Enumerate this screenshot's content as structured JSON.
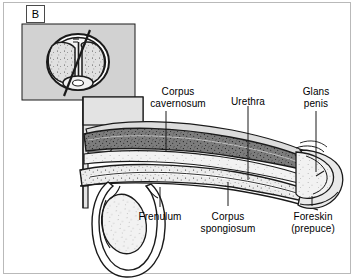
{
  "figure": {
    "panel_letter": "B",
    "background_color": "#ffffff",
    "inset_fill": "#d2d2d2",
    "body_wall_fill": "#e3e3e3",
    "cavernosum_fill": "#7c7c7c",
    "spongiosum_fill": "#e8e8e8",
    "outline_color": "#1a1a1a"
  },
  "labels": {
    "corpus_cavernosum": {
      "line1": "Corpus",
      "line2": "cavernosum"
    },
    "urethra": {
      "line1": "Urethra"
    },
    "glans_penis": {
      "line1": "Glans",
      "line2": "penis"
    },
    "frenulum": {
      "line1": "Frenulum"
    },
    "corpus_spongiosum": {
      "line1": "Corpus",
      "line2": "spongiosum"
    },
    "foreskin": {
      "line1": "Foreskin",
      "line2": "(prepuce)"
    }
  },
  "inset": {
    "caption": "",
    "structures": [
      "corpus cavernosum left",
      "corpus cavernosum right",
      "corpus spongiosum",
      "section plane line"
    ]
  }
}
